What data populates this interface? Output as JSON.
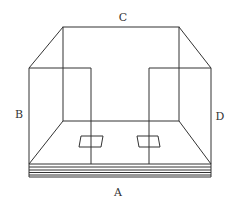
{
  "diagram": {
    "labels": {
      "top": "C",
      "left": "B",
      "right": "D",
      "bottom": "A"
    },
    "colors": {
      "line": "#333333",
      "background": "#ffffff"
    }
  }
}
